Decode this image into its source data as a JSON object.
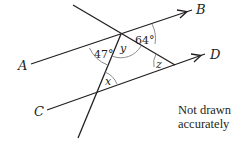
{
  "diagram": {
    "points": {
      "A": "A",
      "B": "B",
      "C": "C",
      "D": "D"
    },
    "angles": {
      "angle_47": "47°",
      "angle_64": "64°",
      "angle_x": "x",
      "angle_y": "y",
      "angle_z": "z"
    },
    "note_line1": "Not drawn",
    "note_line2": "accurately",
    "colors": {
      "line": "#231f20",
      "arc": "#808080"
    }
  }
}
